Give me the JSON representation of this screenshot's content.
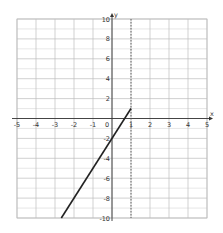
{
  "chart_data": {
    "type": "line",
    "title": "",
    "xlabel": "x",
    "ylabel": "y",
    "xlim": [
      -5,
      5
    ],
    "ylim": [
      -10,
      10
    ],
    "grid": true,
    "x_ticks": [
      -5,
      -4,
      -3,
      -2,
      -1,
      0,
      1,
      2,
      3,
      4,
      5
    ],
    "y_ticks": [
      -10,
      -8,
      -6,
      -4,
      -2,
      2,
      4,
      6,
      8,
      10
    ],
    "x_tick_labels": [
      "-5",
      "-4",
      "-3",
      "-2",
      "-1",
      "0",
      "1",
      "2",
      "3",
      "4",
      "5"
    ],
    "y_tick_labels": [
      "-10",
      "-8",
      "-6",
      "-4",
      "-2",
      "2",
      "4",
      "6",
      "8",
      "10"
    ],
    "series": [
      {
        "name": "y = 3x - 2",
        "equation": "y = 3x - 2",
        "x": [
          -2.667,
          1
        ],
        "y": [
          -10,
          1
        ],
        "color": "#222222",
        "style": "solid"
      }
    ],
    "annotations": [
      {
        "type": "vertical-dashed-line",
        "x": 1,
        "color": "#555555"
      }
    ]
  },
  "axis_labels": {
    "x": "x",
    "y": "y"
  }
}
